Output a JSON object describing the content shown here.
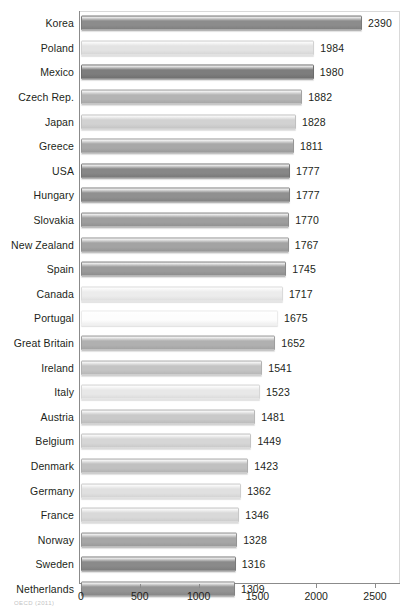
{
  "chart_data": {
    "type": "bar",
    "orientation": "horizontal",
    "title": "",
    "subtitle": "",
    "xlabel": "",
    "ylabel": "",
    "xlim": [
      0,
      2500
    ],
    "grid": false,
    "legend": null,
    "x_ticks": [
      0,
      500,
      1000,
      1500,
      2000,
      2500
    ],
    "x_tick_labels": [
      "0",
      "500",
      "1000",
      "1500",
      "2000",
      "2500"
    ],
    "categories": [
      "Korea",
      "Poland",
      "Mexico",
      "Czech Rep.",
      "Japan",
      "Greece",
      "USA",
      "Hungary",
      "Slovakia",
      "New Zealand",
      "Spain",
      "Canada",
      "Portugal",
      "Great Britain",
      "Ireland",
      "Italy",
      "Austria",
      "Belgium",
      "Denmark",
      "Germany",
      "France",
      "Norway",
      "Sweden",
      "Netherlands"
    ],
    "values": [
      2390,
      1984,
      1980,
      1882,
      1828,
      1811,
      1777,
      1777,
      1770,
      1767,
      1745,
      1717,
      1675,
      1652,
      1541,
      1523,
      1481,
      1449,
      1423,
      1362,
      1346,
      1328,
      1316,
      1309
    ],
    "value_labels": [
      "2390",
      "1984",
      "1980",
      "1882",
      "1828",
      "1811",
      "1777",
      "1777",
      "1770",
      "1767",
      "1745",
      "1717",
      "1675",
      "1652",
      "1541",
      "1523",
      "1481",
      "1449",
      "1423",
      "1362",
      "1346",
      "1328",
      "1316",
      "1309"
    ],
    "bar_colors": [
      "#8c8c8c",
      "#e3e3e3",
      "#7d7d7d",
      "#b4b4b4",
      "#d2d2d2",
      "#a8a8a8",
      "#878787",
      "#909090",
      "#9e9e9e",
      "#a3a3a3",
      "#9a9a9a",
      "#ececec",
      "#fdfdfd",
      "#b0b0b0",
      "#c4c4c4",
      "#e8e8e8",
      "#c9c9c9",
      "#d6d6d6",
      "#c0c0c0",
      "#e0e0e0",
      "#d9d9d9",
      "#a6a6a6",
      "#8a8a8a",
      "#949494"
    ]
  },
  "axis": {
    "spine_color": "#8b8b8b",
    "frame_color": "#d9d9d9"
  },
  "caption": {
    "source_text": "OECD (2011)"
  }
}
